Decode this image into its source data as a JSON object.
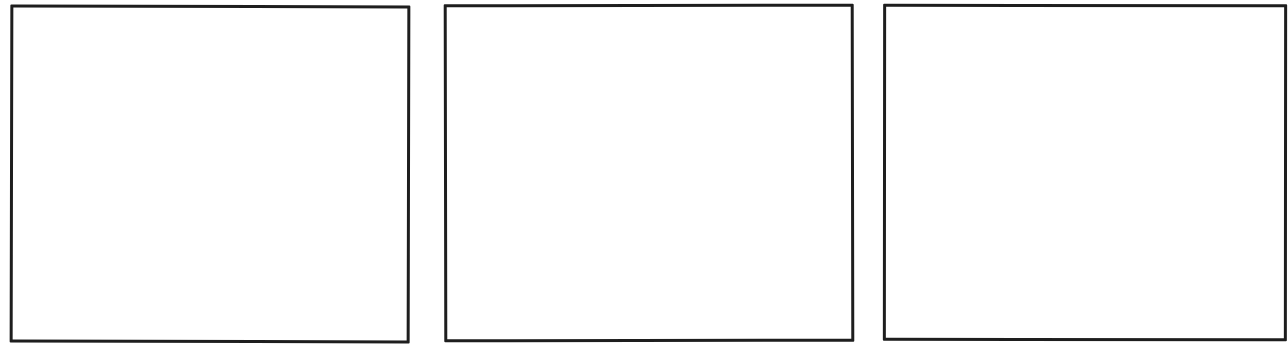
{
  "comic": {
    "layout": "horizontal-strip",
    "panel_count": 3,
    "panels": [
      {
        "index": 1,
        "content": ""
      },
      {
        "index": 2,
        "content": ""
      },
      {
        "index": 3,
        "content": ""
      }
    ],
    "colors": {
      "border": "#1e1e1e",
      "background": "#ffffff"
    }
  }
}
